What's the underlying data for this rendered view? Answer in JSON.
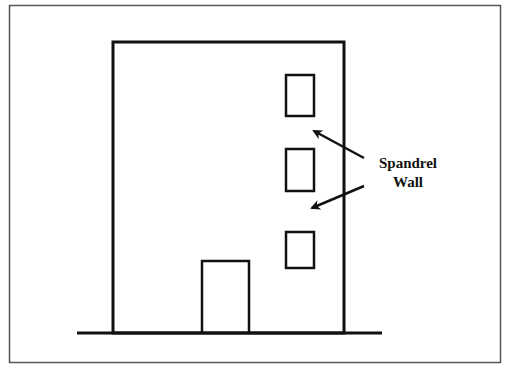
{
  "diagram": {
    "label_line1": "Spandrel",
    "label_line2": "Wall",
    "colors": {
      "stroke": "#111111",
      "frame": "#555555",
      "background": "#ffffff"
    },
    "elements": {
      "building": {
        "x": 113,
        "y": 42,
        "w": 231,
        "h": 291
      },
      "windows": [
        {
          "x": 286,
          "y": 75,
          "w": 28,
          "h": 41
        },
        {
          "x": 286,
          "y": 149,
          "w": 28,
          "h": 42
        },
        {
          "x": 286,
          "y": 232,
          "w": 28,
          "h": 36
        }
      ],
      "door": {
        "x": 202,
        "y": 261,
        "w": 47,
        "h": 72
      },
      "ground": {
        "x1": 77,
        "x2": 382,
        "y": 333
      },
      "arrows": [
        {
          "from": [
            364,
            158
          ],
          "to": [
            312,
            130
          ]
        },
        {
          "from": [
            364,
            185
          ],
          "to": [
            310,
            208
          ]
        }
      ]
    }
  }
}
